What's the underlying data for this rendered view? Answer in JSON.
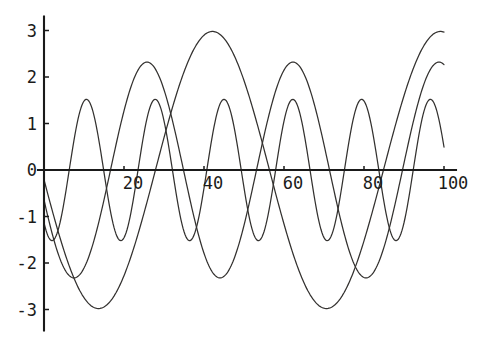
{
  "chart_data": {
    "type": "line",
    "title": "",
    "subtitle": "",
    "xlabel": "",
    "ylabel": "",
    "xlim": [
      -1.5,
      103
    ],
    "ylim": [
      -3.45,
      3.3
    ],
    "grid": false,
    "legend": "none",
    "axis_style": "centered-spines",
    "x_ticks": [
      20,
      40,
      60,
      80,
      100
    ],
    "x_tick_labels": [
      "20",
      "40",
      "60",
      "80",
      "100"
    ],
    "y_ticks": [
      3,
      2,
      1,
      0,
      -1,
      -2,
      -3
    ],
    "y_tick_labels": [
      "3",
      "2",
      "1",
      "0",
      "-1",
      "-2",
      "-3"
    ],
    "x_domain": [
      0,
      100
    ],
    "sample_step": 0.25,
    "series": [
      {
        "name": "fast-oscillation",
        "kind": "damped-free-sine",
        "amplitude": 1.52,
        "period": 17.2,
        "phase_deg": 228,
        "offset": 0.0,
        "color": "#33312f",
        "notes": "highest frequency trace; starts near y=1 descending, peaks ~1.45, troughs ~-1.55"
      },
      {
        "name": "medium-oscillation",
        "kind": "sine",
        "amplitude": 2.32,
        "period": 36.5,
        "phase_deg": 196,
        "offset": 0.0,
        "color": "#33312f",
        "notes": "peaks ~2.0 near x=17, ~2.3 near x=26 region; troughs near -2.35 and -2.65"
      },
      {
        "name": "slow-oscillation",
        "kind": "sine",
        "amplitude": 2.98,
        "period": 57.0,
        "phase_deg": 184,
        "offset": 0.0,
        "color": "#33312f",
        "notes": "largest amplitude; peak ~2.95 near x=67, trough ~-3.1 near x=96, rises to ~2.2 at x=100"
      }
    ],
    "annotations": [],
    "peaks": [
      {
        "x": 8,
        "y": 1.45
      },
      {
        "x": 17,
        "y": 2.0
      },
      {
        "x": 26,
        "y": 2.3
      },
      {
        "x": 53,
        "y": 2.68
      },
      {
        "x": 67,
        "y": 2.95
      },
      {
        "x": 100,
        "y": 2.2
      }
    ],
    "troughs": [
      {
        "x": 12,
        "y": -1.55
      },
      {
        "x": 19,
        "y": -1.92
      },
      {
        "x": 30,
        "y": -2.35
      },
      {
        "x": 44,
        "y": -2.65
      },
      {
        "x": 78,
        "y": -2.98
      },
      {
        "x": 96,
        "y": -3.12
      }
    ]
  },
  "axes": {
    "origin_label": "0",
    "x_axis_name": "x-axis",
    "y_axis_name": "y-axis"
  }
}
